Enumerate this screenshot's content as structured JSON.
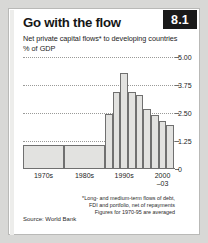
{
  "badge": {
    "label": "8.1"
  },
  "header": {
    "title": "Go with the flow",
    "subtitle": "Net private capital flows* to developing countries",
    "units": "% of GDP"
  },
  "source": {
    "label": "Source: World Bank"
  },
  "footnotes": [
    "*Long- and medium-term flows of debt,",
    "FDI and portfolio, net of repayments",
    "Figures for 1970-95 are averaged"
  ],
  "colors": {
    "badge_bg": "#1a1a1a",
    "badge_text": "#ffffff",
    "bar_fill": "#e2e2e0",
    "bar_stroke": "#707070",
    "grid": "#9a9a98",
    "axis": "#6f6f6d",
    "page_bg": "#ffffff",
    "canvas_bg": "#d8d8d6"
  },
  "chart_data": {
    "type": "bar",
    "title": "Go with the flow",
    "subtitle": "Net private capital flows* to developing countries",
    "ylabel": "% of GDP",
    "xlabel": "",
    "ylim": [
      0,
      5.0
    ],
    "yticks": [
      0,
      1.25,
      2.5,
      3.75,
      5.0
    ],
    "ytick_labels": [
      "0",
      "1.25",
      "2.50",
      "3.75",
      "5.00"
    ],
    "grid": true,
    "gridlines_at": [
      1.25,
      2.5,
      3.75,
      5.0
    ],
    "legend": "none",
    "group_labels": [
      "1970s",
      "1980s",
      "1990s",
      "2000–03"
    ],
    "categories": [
      "1970s",
      "1980s",
      "1990-95",
      "1996",
      "1997",
      "1998",
      "1999",
      "2000",
      "2001",
      "2002",
      "2003"
    ],
    "values": [
      1.05,
      1.05,
      2.45,
      3.45,
      4.3,
      3.45,
      3.3,
      2.7,
      2.4,
      2.15,
      1.95
    ],
    "note": "1970s and 1980s are wide averaged blocks; 1990s and 2000-03 shown as annual step bars"
  }
}
